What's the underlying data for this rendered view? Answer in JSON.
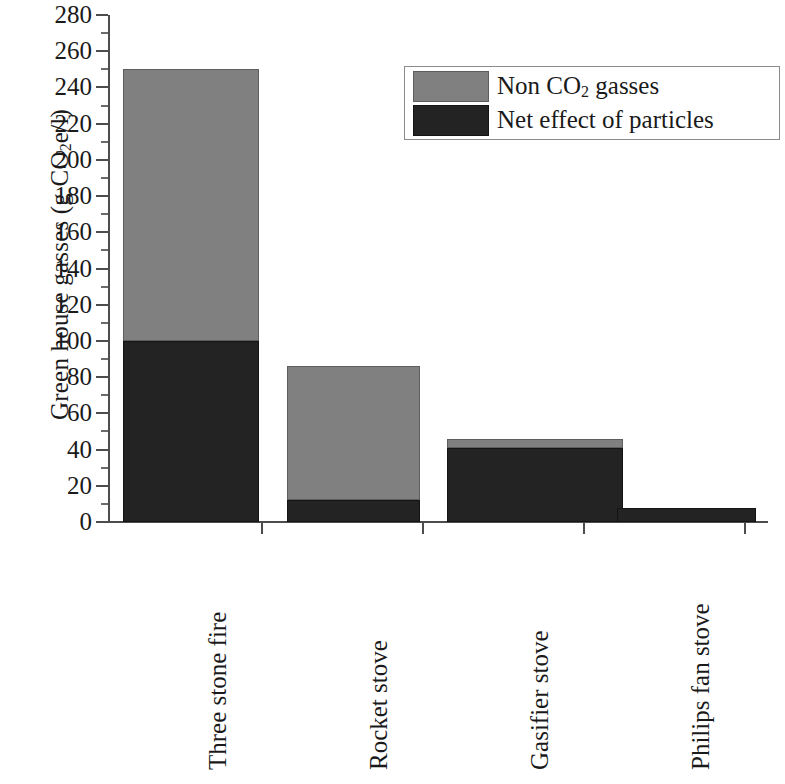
{
  "chart_data": {
    "type": "bar",
    "subtype": "stacked-vertical",
    "title": "",
    "xlabel": "",
    "ylabel": "Green house gasses (g CO2e/l)",
    "ylabel_parts": {
      "pre": "Green house gasses (g CO",
      "sub": "2",
      "post": "e/l)"
    },
    "categories": [
      "Three stone fire",
      "Rocket stove",
      "Gasifier stove",
      "Philips fan stove"
    ],
    "series": [
      {
        "name": "Net effect of particles",
        "color": "#232323",
        "values": [
          100,
          12,
          41,
          8
        ]
      },
      {
        "name": "Non CO2 gasses",
        "color": "#808080",
        "values": [
          150,
          74,
          5,
          0
        ]
      }
    ],
    "totals": [
      250,
      86,
      46,
      8
    ],
    "ylim": [
      0,
      280
    ],
    "ytick_step": 20,
    "yminor_step": 10,
    "ytick_labels": [
      "0",
      "20",
      "40",
      "60",
      "80",
      "100",
      "120",
      "140",
      "160",
      "180",
      "200",
      "220",
      "240",
      "260",
      "280"
    ],
    "grid": false,
    "legend_position": "top-right",
    "legend_entries": [
      {
        "label_pre": "Non CO",
        "label_sub": "2",
        "label_post": " gasses",
        "label_plain": "Non CO2 gasses",
        "color": "#808080"
      },
      {
        "label_pre": "Net effect of particles",
        "label_sub": "",
        "label_post": "",
        "label_plain": "Net effect of particles",
        "color": "#232323"
      }
    ]
  },
  "axis": {
    "y_title_pre": "Green house gasses (g CO",
    "y_title_sub": "2",
    "y_title_post": "e/l)"
  },
  "colors": {
    "gray_series": "#808080",
    "dark_series": "#232323",
    "axis": "#4d4d4d",
    "background": "#ffffff"
  }
}
